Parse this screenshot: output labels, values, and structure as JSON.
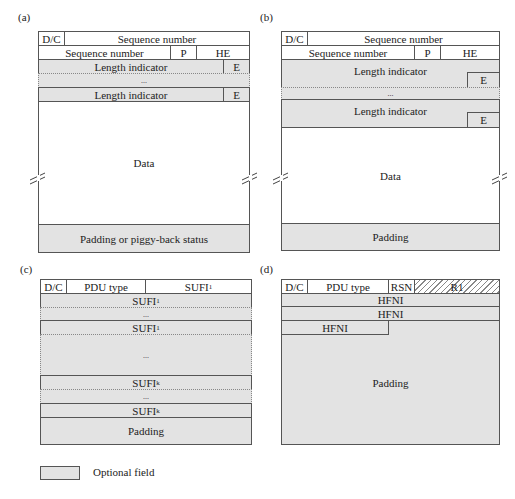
{
  "panels": {
    "a": {
      "label": "(a)",
      "dc": "D/C",
      "seq1": "Sequence number",
      "seq2": "Sequence number",
      "p": "P",
      "he": "HE",
      "li1": "Length indicator",
      "e1": "E",
      "dots": "...",
      "li2": "Length indicator",
      "e2": "E",
      "data": "Data",
      "padding": "Padding or piggy-back status"
    },
    "b": {
      "label": "(b)",
      "dc": "D/C",
      "seq1": "Sequence number",
      "seq2": "Sequence number",
      "p": "P",
      "he": "HE",
      "li1": "Length indicator",
      "e1": "E",
      "dots": "...",
      "li2": "Length indicator",
      "e2": "E",
      "data": "Data",
      "padding": "Padding"
    },
    "c": {
      "label": "(c)",
      "dc": "D/C",
      "pdu_type": "PDU type",
      "sufi": "SUFI",
      "sub1": "1",
      "subk": "k",
      "dots": "...",
      "padding": "Padding"
    },
    "d": {
      "label": "(d)",
      "dc": "D/C",
      "pdu_type": "PDU type",
      "rsn": "RSN",
      "r1": "R1",
      "hfni": "HFNI",
      "padding": "Padding"
    }
  },
  "legend": {
    "label": "Optional field",
    "color": "#e3e3e3"
  }
}
